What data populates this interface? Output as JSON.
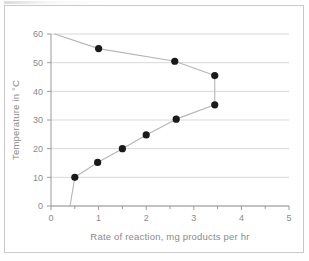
{
  "chart_data": {
    "type": "line",
    "title": "",
    "xlabel": "Rate of reaction, mg products per hr",
    "ylabel": "Temperature in °C",
    "xlim": [
      0,
      5
    ],
    "ylim": [
      0,
      60
    ],
    "xticks": [
      0,
      1,
      2,
      3,
      4,
      5
    ],
    "xtick_labels": [
      "0",
      "1",
      "2",
      "3",
      "4",
      "5"
    ],
    "yticks": [
      0,
      10,
      20,
      30,
      40,
      50,
      60
    ],
    "ytick_labels": [
      "0",
      "10",
      "20",
      "30",
      "40",
      "50",
      "60"
    ],
    "x_minor_tick_step": 0.5,
    "grid": "horizontal",
    "legend": "none",
    "marker": "filled-circle",
    "marker_color": "#1a1a1a",
    "line_color": "#b5b5b5",
    "grid_color": "#d8d8d8",
    "axis_color": "#9a9a9a",
    "series": [
      {
        "name": "Rate of reaction vs temperature",
        "note": "curve traced from low temperature upward, doubling back at high temperature",
        "points": [
          {
            "x": 0.4,
            "y": 0.0,
            "marker": false
          },
          {
            "x": 0.5,
            "y": 10.0,
            "marker": true
          },
          {
            "x": 0.98,
            "y": 15.2,
            "marker": true
          },
          {
            "x": 1.5,
            "y": 20.0,
            "marker": true
          },
          {
            "x": 2.0,
            "y": 24.8,
            "marker": true
          },
          {
            "x": 2.63,
            "y": 30.3,
            "marker": true
          },
          {
            "x": 3.44,
            "y": 35.3,
            "marker": true
          },
          {
            "x": 3.44,
            "y": 45.5,
            "marker": true
          },
          {
            "x": 2.6,
            "y": 50.5,
            "marker": true
          },
          {
            "x": 1.0,
            "y": 54.9,
            "marker": true
          },
          {
            "x": 0.08,
            "y": 60.0,
            "marker": false
          }
        ]
      }
    ]
  },
  "axes": {
    "x_title": "Rate of reaction, mg products per hr",
    "y_title": "Temperature in °C"
  }
}
